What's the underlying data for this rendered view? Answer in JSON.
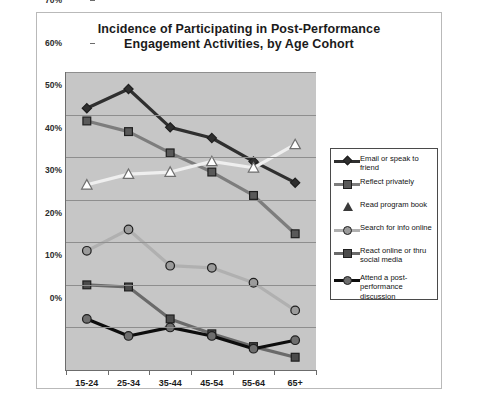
{
  "chart_data": {
    "type": "line",
    "title": "Incidence of Participating in Post-Performance Engagement Activities, by Age Cohort",
    "title_line1": "Incidence of Participating in Post-Performance",
    "title_line2": "Engagement Activities, by Age Cohort",
    "xlabel": "",
    "ylabel": "",
    "categories": [
      "15-24",
      "25-34",
      "35-44",
      "45-54",
      "55-64",
      "65+"
    ],
    "ylim": [
      0,
      70
    ],
    "ytick_labels": [
      "0%",
      "10%",
      "20%",
      "30%",
      "40%",
      "50%",
      "60%",
      "70%"
    ],
    "ytick_values": [
      0,
      10,
      20,
      30,
      40,
      50,
      60,
      70
    ],
    "grid": true,
    "legend_position": "right",
    "series": [
      {
        "name": "Email or speak to friend",
        "marker": "diamond",
        "color": "#2f2f2f",
        "line_color": "#2f2f2f",
        "values": [
          61.5,
          66,
          57,
          54.5,
          49,
          44
        ]
      },
      {
        "name": "Reflect privately",
        "marker": "square",
        "color": "#595959",
        "line_color": "#7d7d7d",
        "values": [
          58.5,
          56,
          51,
          46.5,
          41,
          32
        ]
      },
      {
        "name": "Read program book",
        "marker": "triangle",
        "color": "#ffffff",
        "line_color": "#efefef",
        "values": [
          43.5,
          46,
          46.5,
          49,
          47.5,
          53
        ]
      },
      {
        "name": "Search for info online",
        "marker": "circle",
        "color": "#9b9b9b",
        "line_color": "#b0b0b0",
        "values": [
          28,
          33,
          24.5,
          24,
          20.5,
          14
        ]
      },
      {
        "name": "React online or thru social media",
        "marker": "square",
        "color": "#4b4b4b",
        "line_color": "#6a6a6a",
        "values": [
          20,
          19.5,
          12,
          8.5,
          5.5,
          3
        ]
      },
      {
        "name": "Attend a post-performance discussion",
        "marker": "circle",
        "color": "#6e6e6e",
        "line_color": "#0d0d0d",
        "values": [
          12,
          8,
          10,
          8,
          5,
          7
        ]
      }
    ]
  },
  "legend": {
    "entries": [
      "Email or speak to friend",
      "Reflect privately",
      "Read program book",
      "Search for info online",
      "React online or thru social media",
      "Attend a post-performance discussion"
    ]
  },
  "colors": {
    "plot_background": "#c6c6c6",
    "page_background": "#ffffff",
    "gridline": "#8e8e8e",
    "axis": "#6c6c6c",
    "text": "#1b1b1b"
  }
}
